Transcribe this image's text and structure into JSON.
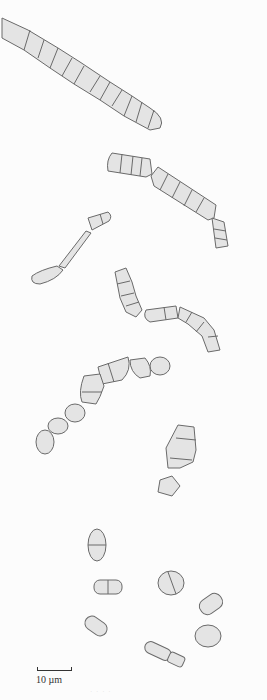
{
  "figure": {
    "scale_bar": {
      "label": "10 µm"
    },
    "caption_faint": "· · · ·"
  },
  "colors": {
    "cell_fill": "#e4e4e4",
    "cell_outline": "#6a6a6a",
    "background": "#fcfcfc"
  }
}
